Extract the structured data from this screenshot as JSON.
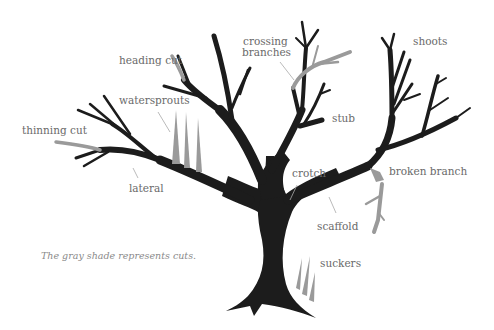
{
  "diagram": {
    "caption": "The gray shade represents cuts.",
    "colors": {
      "tree": "#1c1c1c",
      "cut": "#9a9a9a",
      "label": "#6a6a6a",
      "leader": "#a8a8a8",
      "background": "#ffffff"
    },
    "labels": {
      "heading_cut": "heading cut",
      "crossing_branches_line1": "crossing",
      "crossing_branches_line2": "branches",
      "shoots": "shoots",
      "watersprouts": "watersprouts",
      "thinning_cut": "thinning cut",
      "stub": "stub",
      "lateral": "lateral",
      "crotch": "crotch",
      "broken_branch": "broken branch",
      "scaffold": "scaffold",
      "suckers": "suckers"
    }
  }
}
